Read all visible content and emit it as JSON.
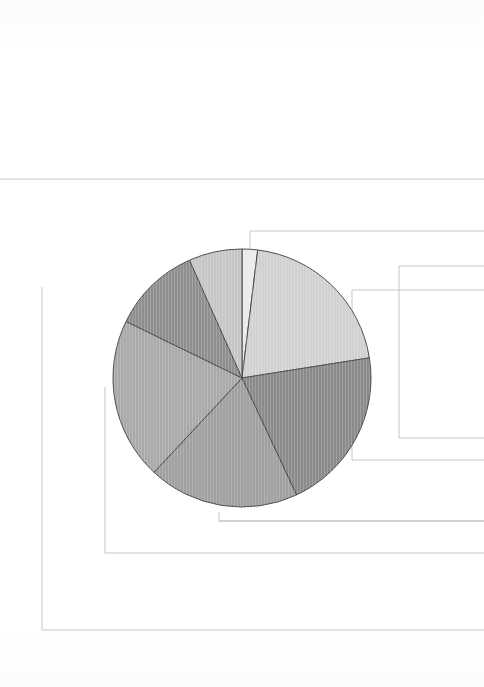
{
  "page": {
    "background_color": "#ffffff",
    "width": 484,
    "height": 687
  },
  "chart_data": {
    "type": "pie",
    "title": "",
    "subtitle": "",
    "xlabel": "",
    "ylabel": "",
    "legend_position": "none",
    "grid": false,
    "center": {
      "x": 242,
      "y": 378
    },
    "radius": 129,
    "start_angle_deg": 0,
    "direction": "clockwise",
    "total_degrees": 360,
    "categories": [
      "Segment 1",
      "Segment 2",
      "Segment 3",
      "Segment 4",
      "Segment 5",
      "Segment 6",
      "Segment 7"
    ],
    "values": [
      7,
      74,
      74,
      68,
      73,
      40,
      24
    ],
    "percentages": [
      1.9,
      20.6,
      20.6,
      18.9,
      20.3,
      11.1,
      6.7
    ],
    "angles_deg": [
      7,
      74,
      74,
      68,
      73,
      40,
      24
    ],
    "boundaries_deg": [
      0,
      7,
      81,
      155,
      223,
      296,
      336,
      360
    ],
    "colors": [
      "#eceaea",
      "#d2d0d0",
      "#8b8b8b",
      "#a0a0a0",
      "#a9a9a9",
      "#8f8f8f",
      "#c7c5c5"
    ],
    "slice_edge_color": "#4a4a4a",
    "slice_edge_width": 1,
    "hatch": "vertical-fine-lines"
  },
  "frames": {
    "stroke_color": "#b9b9b9",
    "stroke_width": 0.8,
    "paths": [
      {
        "name": "frame-top-rule",
        "d": "M 0 179 L 484 179"
      },
      {
        "name": "frame-outer-left",
        "d": "M 484 231 L 250 231 L 250 249"
      },
      {
        "name": "frame-mid-right",
        "d": "M 484 290 L 352 290 L 352 460 L 484 460"
      },
      {
        "name": "frame-lower-right",
        "d": "M 484 266 L 399 266 L 399 438 L 484 438"
      },
      {
        "name": "frame-big-left",
        "d": "M 42 287 L 42 630 L 484 630"
      },
      {
        "name": "frame-inner-left",
        "d": "M 105 387 L 105 553 L 484 553"
      },
      {
        "name": "frame-inner-bottom",
        "d": "M 484 521 L 219 521 L 219 512"
      },
      {
        "name": "frame-bottom-stub",
        "d": "M 484 521 L 219 521"
      }
    ]
  }
}
